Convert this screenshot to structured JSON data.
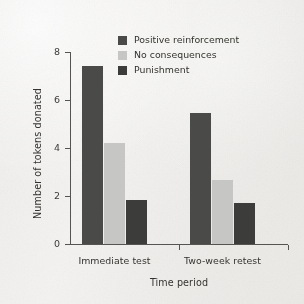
{
  "chart_data": {
    "type": "bar",
    "title": "",
    "xlabel": "Time period",
    "ylabel": "Number of tokens donated",
    "categories": [
      "Immediate test",
      "Two-week retest"
    ],
    "series": [
      {
        "name": "Positive reinforcement",
        "color": "#4a4a49",
        "values": [
          7.4,
          5.45
        ]
      },
      {
        "name": "No consequences",
        "color": "#c6c6c4",
        "values": [
          4.2,
          2.65
        ]
      },
      {
        "name": "Punishment",
        "color": "#3c3c3b",
        "values": [
          1.85,
          1.7
        ]
      }
    ],
    "ylim": [
      0,
      8
    ],
    "yticks": [
      0,
      2,
      4,
      6,
      8
    ],
    "ytick_labels": [
      "0",
      "2",
      "4",
      "6",
      "8"
    ],
    "grid": false,
    "legend_position": "top-center"
  }
}
